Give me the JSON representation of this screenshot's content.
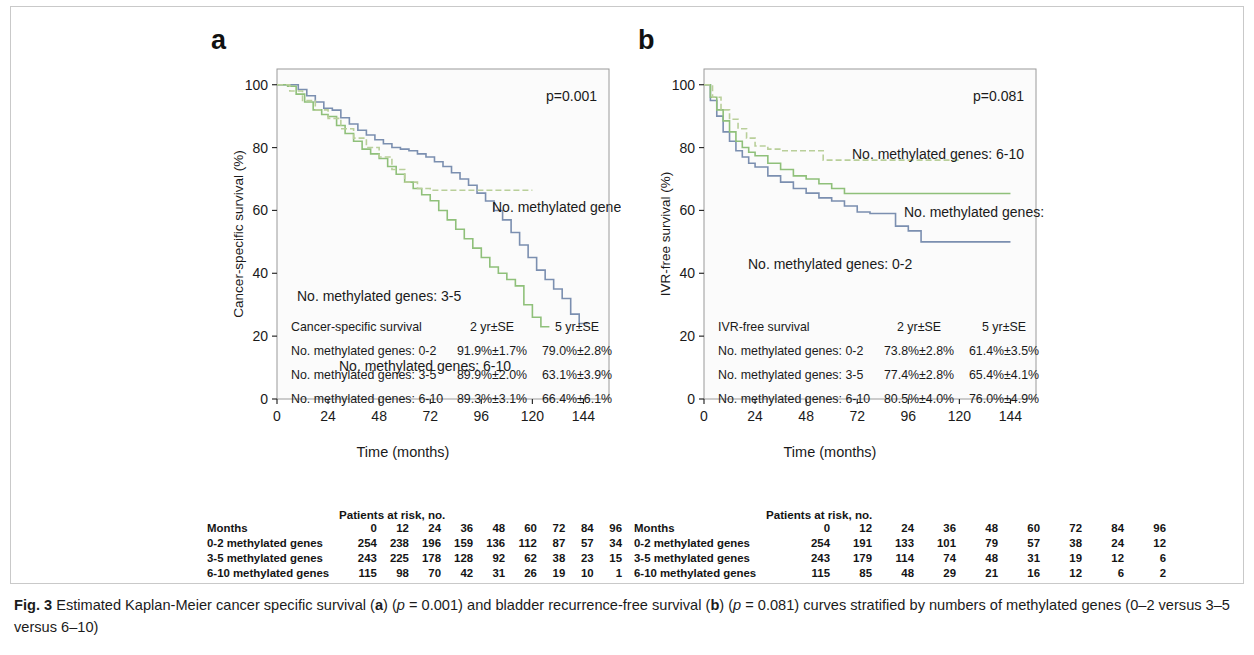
{
  "figure": {
    "label": "Fig. 3",
    "caption_part1": "Estimated Kaplan-Meier cancer specific survival (",
    "caption_a": "a",
    "caption_part2": ") (",
    "caption_p1_italic": "p",
    "caption_p1_value": " = 0.001) and bladder recurrence-free survival (",
    "caption_b": "b",
    "caption_part3": ") (",
    "caption_p2_italic": "p",
    "caption_p2_value": " = 0.081) curves stratified by numbers of methylated genes (0–2 versus 3–5 versus 6–10)"
  },
  "colors": {
    "series_0_2": "#7b8fb0",
    "series_3_5": "#8fc07a",
    "series_6_10": "#b9cf9a",
    "axis": "#2b2b2b",
    "frame": "#9a9a9a",
    "plot_bg": "#fbfbfb"
  },
  "panel_a": {
    "letter": "a",
    "pvalue": "p=0.001",
    "curve_labels": [
      {
        "text": "No. methylated genes: 0-2",
        "x": 215,
        "y": 143
      },
      {
        "text": "No. methylated genes: 3-5",
        "x": 20,
        "y": 232
      },
      {
        "text": "No. methylated genes: 6-10",
        "x": 62,
        "y": 302
      }
    ],
    "inset": {
      "title": "Cancer-specific survival",
      "col1": "2 yr±SE",
      "col2": "5 yr±SE",
      "rows": [
        {
          "label": "No. methylated genes: 0-2",
          "v2yr": "91.9%±1.7%",
          "v5yr": "79.0%±2.8%"
        },
        {
          "label": "No. methylated genes: 3-5",
          "v2yr": "89.9%±2.0%",
          "v5yr": "63.1%±3.9%"
        },
        {
          "label": "No. methylated genes: 6-10",
          "v2yr": "89.3%±3.1%",
          "v5yr": "66.4%±6.1%"
        }
      ]
    },
    "risk": {
      "title": "Patients at risk, no.",
      "row_header": "Months",
      "months": [
        "0",
        "12",
        "24",
        "36",
        "48",
        "60",
        "72",
        "84",
        "96"
      ],
      "rows": [
        {
          "label": "0-2 methylated genes",
          "values": [
            "254",
            "238",
            "196",
            "159",
            "136",
            "112",
            "87",
            "57",
            "34"
          ]
        },
        {
          "label": "3-5 methylated genes",
          "values": [
            "243",
            "225",
            "178",
            "128",
            "92",
            "62",
            "38",
            "23",
            "15"
          ]
        },
        {
          "label": "6-10 methylated genes",
          "values": [
            "115",
            "98",
            "70",
            "42",
            "31",
            "26",
            "19",
            "10",
            "1"
          ]
        }
      ]
    }
  },
  "panel_b": {
    "letter": "b",
    "pvalue": "p=0.081",
    "curve_labels": [
      {
        "text": "No. methylated genes: 6-10",
        "x": 148,
        "y": 90
      },
      {
        "text": "No. methylated genes: 3-5",
        "x": 200,
        "y": 148
      },
      {
        "text": "No. methylated genes: 0-2",
        "x": 44,
        "y": 200
      }
    ],
    "inset": {
      "title": "IVR-free survival",
      "col1": "2 yr±SE",
      "col2": "5 yr±SE",
      "rows": [
        {
          "label": "No. methylated genes: 0-2",
          "v2yr": "73.8%±2.8%",
          "v5yr": "61.4%±3.5%"
        },
        {
          "label": "No. methylated genes: 3-5",
          "v2yr": "77.4%±2.8%",
          "v5yr": "65.4%±4.1%"
        },
        {
          "label": "No. methylated genes: 6-10",
          "v2yr": "80.5%±4.0%",
          "v5yr": "76.0%±4.9%"
        }
      ]
    },
    "risk": {
      "title": "Patients at risk, no.",
      "row_header": "Months",
      "months": [
        "0",
        "12",
        "24",
        "36",
        "48",
        "60",
        "72",
        "84",
        "96"
      ],
      "rows": [
        {
          "label": "0-2 methylated genes",
          "values": [
            "254",
            "191",
            "133",
            "101",
            "79",
            "57",
            "38",
            "24",
            "12"
          ]
        },
        {
          "label": "3-5 methylated genes",
          "values": [
            "243",
            "179",
            "114",
            "74",
            "48",
            "31",
            "19",
            "12",
            "6"
          ]
        },
        {
          "label": "6-10 methylated genes",
          "values": [
            "115",
            "85",
            "48",
            "29",
            "21",
            "16",
            "12",
            "6",
            "2"
          ]
        }
      ]
    }
  },
  "chart_data": [
    {
      "type": "line",
      "panel": "a",
      "title": "Cancer-specific survival",
      "xlabel": "Time (months)",
      "ylabel": "Cancer-specific survival (%)",
      "xlim": [
        0,
        156
      ],
      "ylim": [
        0,
        105
      ],
      "xticks": [
        0,
        24,
        48,
        72,
        96,
        120,
        144
      ],
      "yticks": [
        0,
        20,
        40,
        60,
        80,
        100
      ],
      "grid": false,
      "legend": "inline-annotations",
      "pvalue": 0.001,
      "series": [
        {
          "name": "No. methylated genes: 0-2",
          "color": "#7b8fb0",
          "dash": false,
          "x": [
            0,
            6,
            10,
            14,
            18,
            22,
            26,
            30,
            34,
            38,
            42,
            46,
            50,
            54,
            58,
            62,
            66,
            70,
            74,
            78,
            82,
            86,
            90,
            94,
            98,
            102,
            106,
            110,
            114,
            118,
            122,
            126,
            130,
            134,
            138,
            142,
            146
          ],
          "y": [
            100,
            100,
            98.5,
            96.5,
            94.5,
            92.5,
            91.9,
            89.5,
            87.5,
            85.5,
            84.0,
            82.5,
            81.2,
            80.0,
            79.5,
            79.0,
            78.0,
            77.0,
            75.5,
            74.0,
            72.0,
            70.0,
            68.0,
            65.5,
            63.0,
            60.0,
            57.0,
            53.0,
            49.0,
            45.0,
            41.0,
            38.0,
            35.0,
            32.0,
            27.0,
            24.0,
            24.0
          ]
        },
        {
          "name": "No. methylated genes: 3-5",
          "color": "#8fc07a",
          "dash": false,
          "x": [
            0,
            5,
            9,
            13,
            17,
            21,
            24,
            28,
            32,
            36,
            40,
            44,
            48,
            52,
            56,
            60,
            64,
            68,
            72,
            76,
            80,
            84,
            88,
            92,
            96,
            100,
            104,
            108,
            112,
            116,
            120,
            124,
            128
          ],
          "y": [
            100,
            99.5,
            97.0,
            94.5,
            92.0,
            90.5,
            89.9,
            87.0,
            84.5,
            82.0,
            79.5,
            78.0,
            76.5,
            74.0,
            71.5,
            69.0,
            67.0,
            65.0,
            63.1,
            60.0,
            57.0,
            54.0,
            51.0,
            48.0,
            45.0,
            42.0,
            40.0,
            38.0,
            36.0,
            30.0,
            26.0,
            23.0,
            23.0
          ]
        },
        {
          "name": "No. methylated genes: 6-10",
          "color": "#b9cf9a",
          "dash": true,
          "x": [
            0,
            6,
            12,
            18,
            24,
            30,
            36,
            42,
            48,
            54,
            60,
            66,
            72,
            78,
            84,
            90,
            96,
            102,
            108,
            114,
            120
          ],
          "y": [
            100,
            98.0,
            95.0,
            92.0,
            89.3,
            86.0,
            83.0,
            80.0,
            77.0,
            73.0,
            69.0,
            67.0,
            66.4,
            66.4,
            66.4,
            66.4,
            66.4,
            66.4,
            66.4,
            66.4,
            66.4
          ]
        }
      ]
    },
    {
      "type": "line",
      "panel": "b",
      "title": "IVR-free survival",
      "xlabel": "Time (months)",
      "ylabel": "IVR-free survival (%)",
      "xlim": [
        0,
        156
      ],
      "ylim": [
        0,
        105
      ],
      "xticks": [
        0,
        24,
        48,
        72,
        96,
        120,
        144
      ],
      "yticks": [
        0,
        20,
        40,
        60,
        80,
        100
      ],
      "grid": false,
      "legend": "inline-annotations",
      "pvalue": 0.081,
      "series": [
        {
          "name": "No. methylated genes: 0-2",
          "color": "#7b8fb0",
          "dash": false,
          "x": [
            0,
            3,
            6,
            9,
            12,
            15,
            18,
            21,
            24,
            30,
            36,
            42,
            48,
            54,
            60,
            66,
            72,
            78,
            84,
            90,
            96,
            102,
            110,
            120,
            132,
            144
          ],
          "y": [
            100,
            95.0,
            90.0,
            85.0,
            82.0,
            79.0,
            77.0,
            75.0,
            73.8,
            71.0,
            69.0,
            67.0,
            65.5,
            64.0,
            63.0,
            61.4,
            59.5,
            59.0,
            59.0,
            55.0,
            53.5,
            50.0,
            50.0,
            50.0,
            50.0,
            50.0
          ]
        },
        {
          "name": "No. methylated genes: 3-5",
          "color": "#8fc07a",
          "dash": false,
          "x": [
            0,
            3,
            6,
            9,
            12,
            15,
            18,
            21,
            24,
            30,
            36,
            42,
            48,
            54,
            60,
            66,
            72,
            80,
            90,
            100,
            110,
            120,
            132,
            144
          ],
          "y": [
            100,
            96.0,
            92.0,
            88.5,
            85.0,
            82.0,
            80.0,
            78.5,
            77.4,
            75.0,
            73.0,
            71.0,
            70.0,
            68.5,
            67.0,
            65.4,
            65.4,
            65.4,
            65.4,
            65.4,
            65.4,
            65.4,
            65.4,
            65.4
          ]
        },
        {
          "name": "No. methylated genes: 6-10",
          "color": "#b9cf9a",
          "dash": true,
          "x": [
            0,
            4,
            8,
            12,
            16,
            20,
            24,
            30,
            36,
            42,
            48,
            56,
            64,
            72,
            80,
            90,
            100,
            110,
            120
          ],
          "y": [
            100,
            96.0,
            92.0,
            89.0,
            86.0,
            83.0,
            80.5,
            79.5,
            79.0,
            79.0,
            79.0,
            76.0,
            76.0,
            76.0,
            76.0,
            76.0,
            76.0,
            76.0,
            76.0
          ]
        }
      ]
    }
  ]
}
